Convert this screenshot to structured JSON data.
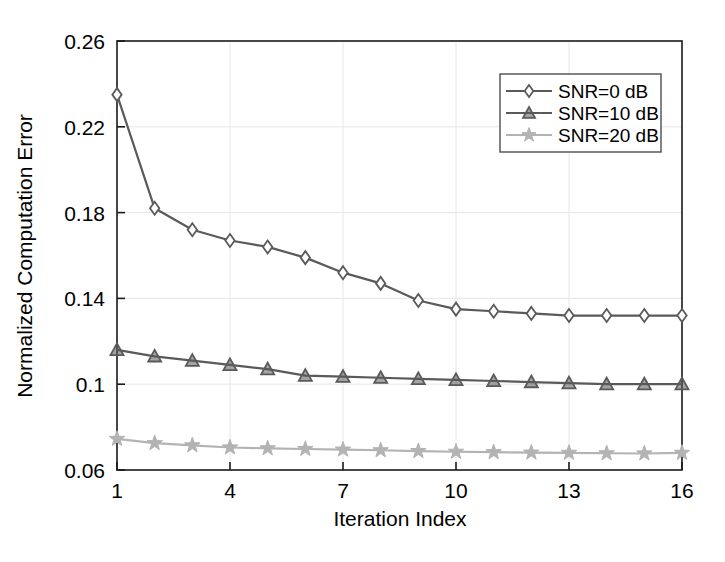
{
  "chart_data": {
    "type": "line",
    "title": "",
    "xlabel": "Iteration Index",
    "ylabel": "Normalized Computation Error",
    "xlim": [
      1,
      16
    ],
    "ylim": [
      0.06,
      0.26
    ],
    "xticks": [
      1,
      4,
      7,
      10,
      13,
      16
    ],
    "xtick_labels": [
      "1",
      "4",
      "7",
      "10",
      "13",
      "16"
    ],
    "yticks": [
      0.06,
      0.1,
      0.14,
      0.18,
      0.22,
      0.26
    ],
    "ytick_labels": [
      "0.06",
      "0.1",
      "0.14",
      "0.18",
      "0.22",
      "0.26"
    ],
    "grid": true,
    "legend_position": "upper right",
    "x": [
      1,
      2,
      3,
      4,
      5,
      6,
      7,
      8,
      9,
      10,
      11,
      12,
      13,
      14,
      15,
      16
    ],
    "series": [
      {
        "name": "SNR=0 dB",
        "marker": "diamond",
        "color": "#5a5a5a",
        "values": [
          0.235,
          0.182,
          0.172,
          0.167,
          0.164,
          0.159,
          0.152,
          0.147,
          0.139,
          0.135,
          0.134,
          0.133,
          0.132,
          0.132,
          0.132,
          0.132
        ]
      },
      {
        "name": "SNR=10 dB",
        "marker": "triangle",
        "color": "#5a5a5a",
        "values": [
          0.116,
          0.113,
          0.111,
          0.109,
          0.107,
          0.104,
          0.1035,
          0.103,
          0.1025,
          0.102,
          0.1015,
          0.101,
          0.1005,
          0.1,
          0.1,
          0.1
        ]
      },
      {
        "name": "SNR=20 dB",
        "marker": "star",
        "color": "#b3b3b3",
        "values": [
          0.0745,
          0.0725,
          0.0715,
          0.0705,
          0.0701,
          0.0698,
          0.0695,
          0.0692,
          0.0688,
          0.0685,
          0.0683,
          0.0681,
          0.068,
          0.0678,
          0.0677,
          0.068
        ]
      }
    ]
  },
  "legend": {
    "entries": [
      {
        "label": "SNR=0 dB"
      },
      {
        "label": "SNR=10 dB"
      },
      {
        "label": "SNR=20 dB"
      }
    ]
  },
  "axes": {
    "x_title": "Iteration Index",
    "y_title": "Normalized Computation Error"
  },
  "colors": {
    "axis": "#1a1a1a",
    "grid": "#e6e6e6",
    "dark_series": "#5a5a5a",
    "light_series": "#b3b3b3",
    "background": "#ffffff"
  }
}
